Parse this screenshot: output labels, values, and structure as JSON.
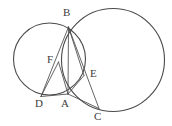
{
  "figure": {
    "width": 172,
    "height": 126,
    "background_color": "#ffffff",
    "stroke_color": "#3c3c3c",
    "label_color": "#3c3c3c"
  },
  "circles": [
    {
      "name": "left-circle",
      "cx": 49.5,
      "cy": 59.0,
      "r": 36.0,
      "stroke": "#4a4a4a",
      "stroke_width": 1.0
    },
    {
      "name": "right-circle",
      "cx": 113.0,
      "cy": 60.0,
      "r": 51.5,
      "stroke": "#4a4a4a",
      "stroke_width": 1.0
    }
  ],
  "points": [
    {
      "id": "B",
      "label": "B",
      "x": 68.5,
      "y": 27.0,
      "label_x": 63.0,
      "label_y": 8.0
    },
    {
      "id": "F",
      "label": "F",
      "x": 58.5,
      "y": 62.0,
      "label_x": 47.0,
      "label_y": 55.0
    },
    {
      "id": "E",
      "label": "E",
      "x": 84.0,
      "y": 75.5,
      "label_x": 91.0,
      "label_y": 69.0
    },
    {
      "id": "D",
      "label": "D",
      "x": 41.0,
      "y": 96.5,
      "label_x": 37.0,
      "label_y": 98.0
    },
    {
      "id": "A",
      "label": "A",
      "x": 68.0,
      "y": 94.0,
      "label_x": 61.0,
      "label_y": 98.0
    },
    {
      "id": "C",
      "label": "C",
      "x": 99.0,
      "y": 108.5,
      "label_x": 94.0,
      "label_y": 110.0
    }
  ],
  "segments": [
    {
      "name": "segment-B-D",
      "from": "B",
      "to": "D"
    },
    {
      "name": "segment-B-A",
      "from": "B",
      "to": "A"
    },
    {
      "name": "segment-B-C",
      "from": "B",
      "to": "C"
    },
    {
      "name": "segment-D-A",
      "from": "D",
      "to": "A"
    },
    {
      "name": "segment-A-C",
      "from": "A",
      "to": "C"
    },
    {
      "name": "segment-F-A",
      "from": "F",
      "to": "A"
    },
    {
      "name": "segment-D-F",
      "from": "D",
      "to": "F"
    },
    {
      "name": "segment-A-E",
      "from": "A",
      "to": "E"
    },
    {
      "name": "segment-B-E",
      "from": "B",
      "to": "E"
    }
  ]
}
